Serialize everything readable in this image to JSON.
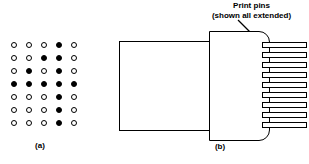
{
  "figure": {
    "panel_a": {
      "label": "(a)",
      "grid": {
        "rows": 7,
        "cols": 5,
        "legend": {
          "on": "filled-dot",
          "off": "open-dot"
        },
        "pattern": [
          [
            0,
            0,
            0,
            1,
            0
          ],
          [
            0,
            0,
            1,
            1,
            0
          ],
          [
            0,
            1,
            0,
            1,
            0
          ],
          [
            1,
            1,
            1,
            1,
            1
          ],
          [
            0,
            0,
            0,
            1,
            0
          ],
          [
            0,
            0,
            0,
            1,
            0
          ],
          [
            0,
            0,
            0,
            1,
            0
          ]
        ]
      }
    },
    "panel_b": {
      "label": "(b)",
      "annotation": {
        "line1": "Print pins",
        "line2": "(shown all extended)"
      },
      "pin_count": 9,
      "pins_y": [
        42,
        52,
        62,
        72,
        82,
        92,
        102,
        112,
        122
      ],
      "parts": {
        "rear_body": "solenoid-body",
        "front_housing": "print-head-housing"
      }
    },
    "colors": {
      "ink": "#000000",
      "paper": "#ffffff"
    }
  }
}
